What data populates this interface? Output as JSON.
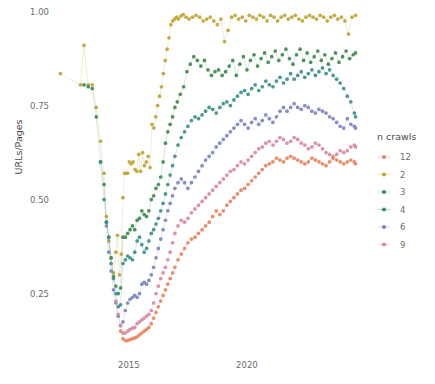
{
  "chart_data": {
    "type": "scatter",
    "title": "",
    "xlabel": "",
    "ylabel": "URLs/Pages",
    "xlim": [
      2012.0,
      2025.0
    ],
    "ylim": [
      0.1,
      1.02
    ],
    "xticks": [
      "2015",
      "2020"
    ],
    "xtick_values": [
      2015,
      2020
    ],
    "yticks": [
      "0.25",
      "0.50",
      "0.75",
      "1.00"
    ],
    "ytick_values": [
      0.25,
      0.5,
      0.75,
      1.0
    ],
    "grid": false,
    "marker": "connected-dots",
    "legend": {
      "title": "n crawls",
      "position": "right",
      "entries": [
        {
          "label": "12",
          "color": "#e8845f"
        },
        {
          "label": "2",
          "color": "#bfa536"
        },
        {
          "label": "3",
          "color": "#3f8a4e"
        },
        {
          "label": "4",
          "color": "#3e8f8c"
        },
        {
          "label": "6",
          "color": "#7b86c2"
        },
        {
          "label": "9",
          "color": "#d98aa0"
        }
      ]
    },
    "series": [
      {
        "name": "2",
        "color": "#bfa536",
        "x": [
          2012.1,
          2012.95,
          2013.1,
          2013.28,
          2013.45,
          2013.62,
          2013.8,
          2013.95,
          2014.05,
          2014.15,
          2014.25,
          2014.35,
          2014.45,
          2014.52,
          2014.6,
          2014.68,
          2014.75,
          2014.82,
          2014.88,
          2014.95,
          2015.02,
          2015.1,
          2015.18,
          2015.26,
          2015.34,
          2015.42,
          2015.5,
          2015.58,
          2015.66,
          2015.74,
          2015.82,
          2015.9,
          2015.98,
          2016.06,
          2016.14,
          2016.22,
          2016.3,
          2016.38,
          2016.46,
          2016.54,
          2016.62,
          2016.7,
          2016.78,
          2016.86,
          2016.94,
          2017.02,
          2017.1,
          2017.2,
          2017.3,
          2017.42,
          2017.55,
          2017.7,
          2017.85,
          2018.0,
          2018.15,
          2018.3,
          2018.45,
          2018.6,
          2018.75,
          2018.9,
          2019.05,
          2019.2,
          2019.35,
          2019.5,
          2019.65,
          2019.8,
          2019.95,
          2020.1,
          2020.25,
          2020.4,
          2020.55,
          2020.7,
          2020.85,
          2021.0,
          2021.15,
          2021.3,
          2021.45,
          2021.6,
          2021.75,
          2021.9,
          2022.05,
          2022.2,
          2022.35,
          2022.5,
          2022.65,
          2022.8,
          2022.95,
          2023.1,
          2023.25,
          2023.4,
          2023.55,
          2023.7,
          2023.85,
          2024.0,
          2024.15,
          2024.3,
          2024.45,
          2024.6
        ],
        "y": [
          0.835,
          0.805,
          0.91,
          0.805,
          0.805,
          0.745,
          0.655,
          0.57,
          0.455,
          0.39,
          0.345,
          0.305,
          0.36,
          0.405,
          0.3,
          0.355,
          0.505,
          0.57,
          0.57,
          0.57,
          0.6,
          0.595,
          0.6,
          0.58,
          0.575,
          0.62,
          0.575,
          0.625,
          0.59,
          0.6,
          0.615,
          0.585,
          0.7,
          0.69,
          0.72,
          0.75,
          0.775,
          0.8,
          0.835,
          0.87,
          0.9,
          0.93,
          0.965,
          0.975,
          0.98,
          0.985,
          0.98,
          0.988,
          0.992,
          0.985,
          0.98,
          0.985,
          0.99,
          0.985,
          0.975,
          0.98,
          0.985,
          0.975,
          0.965,
          0.98,
          0.92,
          0.95,
          0.985,
          0.99,
          0.98,
          0.985,
          0.975,
          0.99,
          0.985,
          0.98,
          0.99,
          0.985,
          0.975,
          0.99,
          0.985,
          0.975,
          0.985,
          0.99,
          0.98,
          0.985,
          0.99,
          0.98,
          0.975,
          0.985,
          0.99,
          0.985,
          0.98,
          0.99,
          0.985,
          0.975,
          0.985,
          0.99,
          0.98,
          0.985,
          0.975,
          0.94,
          0.985,
          0.99
        ]
      },
      {
        "name": "3",
        "color": "#3f8a4e",
        "x": [
          2013.1,
          2013.28,
          2013.45,
          2013.62,
          2013.8,
          2013.95,
          2014.05,
          2014.15,
          2014.25,
          2014.35,
          2014.45,
          2014.55,
          2014.65,
          2014.75,
          2014.85,
          2014.95,
          2015.05,
          2015.15,
          2015.25,
          2015.35,
          2015.45,
          2015.55,
          2015.65,
          2015.75,
          2015.85,
          2015.95,
          2016.05,
          2016.15,
          2016.25,
          2016.35,
          2016.45,
          2016.55,
          2016.65,
          2016.75,
          2016.85,
          2016.95,
          2017.05,
          2017.18,
          2017.32,
          2017.46,
          2017.6,
          2017.75,
          2017.9,
          2018.05,
          2018.2,
          2018.35,
          2018.5,
          2018.65,
          2018.8,
          2018.95,
          2019.1,
          2019.25,
          2019.4,
          2019.55,
          2019.7,
          2019.85,
          2020.0,
          2020.15,
          2020.3,
          2020.45,
          2020.6,
          2020.75,
          2020.9,
          2021.05,
          2021.2,
          2021.35,
          2021.5,
          2021.65,
          2021.8,
          2021.95,
          2022.1,
          2022.25,
          2022.4,
          2022.55,
          2022.7,
          2022.85,
          2023.0,
          2023.15,
          2023.3,
          2023.45,
          2023.6,
          2023.75,
          2023.9,
          2024.05,
          2024.2,
          2024.35,
          2024.5,
          2024.6
        ],
        "y": [
          0.805,
          0.8,
          0.795,
          0.72,
          0.6,
          0.54,
          0.44,
          0.4,
          0.345,
          0.295,
          0.27,
          0.25,
          0.265,
          0.4,
          0.4,
          0.41,
          0.42,
          0.43,
          0.42,
          0.445,
          0.45,
          0.47,
          0.46,
          0.455,
          0.47,
          0.5,
          0.51,
          0.53,
          0.54,
          0.56,
          0.6,
          0.65,
          0.68,
          0.7,
          0.72,
          0.745,
          0.76,
          0.78,
          0.8,
          0.84,
          0.86,
          0.88,
          0.87,
          0.855,
          0.87,
          0.845,
          0.83,
          0.84,
          0.845,
          0.83,
          0.84,
          0.855,
          0.87,
          0.83,
          0.86,
          0.88,
          0.845,
          0.87,
          0.885,
          0.855,
          0.875,
          0.89,
          0.865,
          0.88,
          0.895,
          0.87,
          0.885,
          0.9,
          0.875,
          0.86,
          0.885,
          0.9,
          0.87,
          0.89,
          0.865,
          0.88,
          0.895,
          0.87,
          0.885,
          0.86,
          0.875,
          0.89,
          0.865,
          0.88,
          0.895,
          0.875,
          0.885,
          0.89
        ]
      },
      {
        "name": "4",
        "color": "#3e8f8c",
        "x": [
          2013.8,
          2013.95,
          2014.05,
          2014.15,
          2014.25,
          2014.35,
          2014.45,
          2014.55,
          2014.65,
          2014.75,
          2014.85,
          2014.95,
          2015.05,
          2015.15,
          2015.25,
          2015.35,
          2015.45,
          2015.55,
          2015.65,
          2015.75,
          2015.85,
          2015.95,
          2016.05,
          2016.15,
          2016.25,
          2016.35,
          2016.45,
          2016.55,
          2016.65,
          2016.75,
          2016.85,
          2016.95,
          2017.08,
          2017.22,
          2017.36,
          2017.5,
          2017.65,
          2017.8,
          2017.95,
          2018.1,
          2018.25,
          2018.4,
          2018.55,
          2018.7,
          2018.85,
          2019.0,
          2019.15,
          2019.3,
          2019.45,
          2019.6,
          2019.75,
          2019.9,
          2020.05,
          2020.2,
          2020.35,
          2020.5,
          2020.65,
          2020.8,
          2020.95,
          2021.1,
          2021.25,
          2021.4,
          2021.55,
          2021.7,
          2021.85,
          2022.0,
          2022.15,
          2022.3,
          2022.45,
          2022.6,
          2022.75,
          2022.9,
          2023.05,
          2023.2,
          2023.35,
          2023.5,
          2023.65,
          2023.8,
          2023.95,
          2024.1,
          2024.25,
          2024.4,
          2024.55,
          2024.6
        ],
        "y": [
          0.6,
          0.5,
          0.44,
          0.4,
          0.33,
          0.29,
          0.25,
          0.215,
          0.22,
          0.33,
          0.34,
          0.35,
          0.345,
          0.34,
          0.36,
          0.39,
          0.4,
          0.38,
          0.36,
          0.37,
          0.39,
          0.41,
          0.42,
          0.435,
          0.45,
          0.47,
          0.49,
          0.515,
          0.54,
          0.565,
          0.59,
          0.615,
          0.645,
          0.665,
          0.68,
          0.695,
          0.71,
          0.72,
          0.715,
          0.725,
          0.735,
          0.745,
          0.74,
          0.73,
          0.745,
          0.755,
          0.76,
          0.75,
          0.765,
          0.775,
          0.785,
          0.79,
          0.78,
          0.795,
          0.805,
          0.79,
          0.8,
          0.815,
          0.805,
          0.8,
          0.815,
          0.825,
          0.81,
          0.82,
          0.835,
          0.82,
          0.83,
          0.84,
          0.825,
          0.835,
          0.845,
          0.83,
          0.84,
          0.85,
          0.835,
          0.845,
          0.83,
          0.82,
          0.81,
          0.795,
          0.775,
          0.76,
          0.73,
          0.72
        ]
      },
      {
        "name": "6",
        "color": "#7b86c2",
        "x": [
          2014.05,
          2014.15,
          2014.25,
          2014.35,
          2014.45,
          2014.55,
          2014.65,
          2014.75,
          2014.85,
          2014.95,
          2015.05,
          2015.15,
          2015.25,
          2015.35,
          2015.45,
          2015.55,
          2015.65,
          2015.75,
          2015.85,
          2015.95,
          2016.05,
          2016.15,
          2016.25,
          2016.35,
          2016.45,
          2016.55,
          2016.65,
          2016.75,
          2016.85,
          2016.95,
          2017.08,
          2017.22,
          2017.36,
          2017.5,
          2017.65,
          2017.8,
          2017.95,
          2018.1,
          2018.25,
          2018.4,
          2018.55,
          2018.7,
          2018.85,
          2019.0,
          2019.15,
          2019.3,
          2019.45,
          2019.6,
          2019.75,
          2019.9,
          2020.05,
          2020.2,
          2020.35,
          2020.5,
          2020.65,
          2020.8,
          2020.95,
          2021.1,
          2021.25,
          2021.4,
          2021.55,
          2021.7,
          2021.85,
          2022.0,
          2022.15,
          2022.3,
          2022.45,
          2022.6,
          2022.75,
          2022.9,
          2023.05,
          2023.2,
          2023.35,
          2023.5,
          2023.65,
          2023.8,
          2023.95,
          2024.1,
          2024.25,
          2024.4,
          2024.55,
          2024.6
        ],
        "y": [
          0.43,
          0.36,
          0.31,
          0.26,
          0.225,
          0.19,
          0.165,
          0.175,
          0.205,
          0.225,
          0.235,
          0.24,
          0.245,
          0.24,
          0.25,
          0.275,
          0.28,
          0.275,
          0.285,
          0.3,
          0.32,
          0.345,
          0.37,
          0.395,
          0.42,
          0.445,
          0.47,
          0.49,
          0.51,
          0.53,
          0.545,
          0.555,
          0.545,
          0.53,
          0.545,
          0.56,
          0.575,
          0.59,
          0.605,
          0.615,
          0.625,
          0.64,
          0.65,
          0.66,
          0.67,
          0.68,
          0.69,
          0.7,
          0.71,
          0.7,
          0.69,
          0.705,
          0.715,
          0.7,
          0.71,
          0.725,
          0.715,
          0.705,
          0.72,
          0.735,
          0.745,
          0.735,
          0.745,
          0.755,
          0.745,
          0.74,
          0.75,
          0.745,
          0.735,
          0.73,
          0.74,
          0.735,
          0.73,
          0.72,
          0.715,
          0.705,
          0.695,
          0.69,
          0.715,
          0.7,
          0.695,
          0.69
        ]
      },
      {
        "name": "9",
        "color": "#d98aa0",
        "x": [
          2014.45,
          2014.55,
          2014.65,
          2014.75,
          2014.85,
          2014.95,
          2015.05,
          2015.15,
          2015.25,
          2015.35,
          2015.45,
          2015.55,
          2015.65,
          2015.75,
          2015.85,
          2015.95,
          2016.05,
          2016.15,
          2016.25,
          2016.35,
          2016.45,
          2016.55,
          2016.65,
          2016.75,
          2016.85,
          2016.95,
          2017.08,
          2017.22,
          2017.36,
          2017.5,
          2017.65,
          2017.8,
          2017.95,
          2018.1,
          2018.25,
          2018.4,
          2018.55,
          2018.7,
          2018.85,
          2019.0,
          2019.15,
          2019.3,
          2019.45,
          2019.6,
          2019.75,
          2019.9,
          2020.05,
          2020.2,
          2020.35,
          2020.5,
          2020.65,
          2020.8,
          2020.95,
          2021.1,
          2021.25,
          2021.4,
          2021.55,
          2021.7,
          2021.85,
          2022.0,
          2022.15,
          2022.3,
          2022.45,
          2022.6,
          2022.75,
          2022.9,
          2023.05,
          2023.2,
          2023.35,
          2023.5,
          2023.65,
          2023.8,
          2023.95,
          2024.1,
          2024.25,
          2024.4,
          2024.55,
          2024.6
        ],
        "y": [
          0.23,
          0.195,
          0.165,
          0.145,
          0.145,
          0.15,
          0.155,
          0.158,
          0.16,
          0.17,
          0.175,
          0.18,
          0.185,
          0.19,
          0.195,
          0.205,
          0.225,
          0.25,
          0.27,
          0.29,
          0.305,
          0.32,
          0.34,
          0.36,
          0.385,
          0.41,
          0.43,
          0.445,
          0.44,
          0.45,
          0.465,
          0.475,
          0.485,
          0.495,
          0.505,
          0.515,
          0.525,
          0.535,
          0.545,
          0.555,
          0.565,
          0.575,
          0.58,
          0.59,
          0.6,
          0.595,
          0.605,
          0.615,
          0.625,
          0.635,
          0.64,
          0.65,
          0.655,
          0.645,
          0.655,
          0.665,
          0.66,
          0.65,
          0.655,
          0.665,
          0.66,
          0.65,
          0.645,
          0.635,
          0.64,
          0.65,
          0.645,
          0.635,
          0.625,
          0.62,
          0.615,
          0.62,
          0.63,
          0.625,
          0.63,
          0.64,
          0.645,
          0.64
        ]
      },
      {
        "name": "12",
        "color": "#e8845f",
        "x": [
          2014.65,
          2014.75,
          2014.85,
          2014.95,
          2015.05,
          2015.15,
          2015.25,
          2015.35,
          2015.45,
          2015.55,
          2015.65,
          2015.75,
          2015.85,
          2015.95,
          2016.05,
          2016.15,
          2016.25,
          2016.35,
          2016.45,
          2016.55,
          2016.65,
          2016.75,
          2016.85,
          2016.95,
          2017.08,
          2017.22,
          2017.36,
          2017.5,
          2017.65,
          2017.8,
          2017.95,
          2018.1,
          2018.25,
          2018.4,
          2018.55,
          2018.7,
          2018.85,
          2019.0,
          2019.15,
          2019.3,
          2019.45,
          2019.6,
          2019.75,
          2019.9,
          2020.05,
          2020.2,
          2020.35,
          2020.5,
          2020.65,
          2020.8,
          2020.95,
          2021.1,
          2021.25,
          2021.4,
          2021.55,
          2021.7,
          2021.85,
          2022.0,
          2022.15,
          2022.3,
          2022.45,
          2022.6,
          2022.75,
          2022.9,
          2023.05,
          2023.2,
          2023.35,
          2023.5,
          2023.65,
          2023.8,
          2023.95,
          2024.1,
          2024.25,
          2024.4,
          2024.55,
          2024.6
        ],
        "y": [
          0.15,
          0.13,
          0.125,
          0.125,
          0.128,
          0.13,
          0.132,
          0.135,
          0.14,
          0.145,
          0.15,
          0.155,
          0.16,
          0.17,
          0.185,
          0.2,
          0.215,
          0.23,
          0.245,
          0.26,
          0.275,
          0.29,
          0.305,
          0.32,
          0.34,
          0.355,
          0.37,
          0.385,
          0.395,
          0.4,
          0.41,
          0.42,
          0.43,
          0.44,
          0.455,
          0.47,
          0.46,
          0.47,
          0.485,
          0.495,
          0.505,
          0.515,
          0.525,
          0.53,
          0.54,
          0.55,
          0.56,
          0.57,
          0.58,
          0.59,
          0.595,
          0.6,
          0.61,
          0.605,
          0.6,
          0.61,
          0.615,
          0.61,
          0.605,
          0.6,
          0.595,
          0.6,
          0.61,
          0.605,
          0.6,
          0.595,
          0.59,
          0.6,
          0.61,
          0.605,
          0.6,
          0.595,
          0.6,
          0.605,
          0.6,
          0.595
        ]
      }
    ]
  }
}
